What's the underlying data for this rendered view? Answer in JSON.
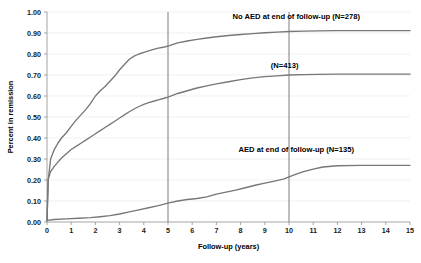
{
  "chart_data": {
    "type": "line",
    "title": "",
    "xlabel": "Follow-up (years)",
    "ylabel": "Percent in remission",
    "xlim": [
      0,
      15
    ],
    "ylim": [
      0,
      1.0
    ],
    "grid": true,
    "legend_position": "inline-annotations",
    "xticks": [
      "0",
      "1",
      "2",
      "3",
      "4",
      "5",
      "6",
      "7",
      "8",
      "9",
      "10",
      "11",
      "12",
      "13",
      "14",
      "15"
    ],
    "yticks": [
      "0.00",
      "0.10",
      "0.20",
      "0.30",
      "0.40",
      "0.50",
      "0.60",
      "0.70",
      "0.80",
      "0.90",
      "1.00"
    ],
    "reference_lines": [
      {
        "name": "year-5-line",
        "x": 5
      },
      {
        "name": "year-10-line",
        "x": 10
      }
    ],
    "series": [
      {
        "name": "No AED at end of follow-up (N=278)",
        "label": "No AED at end of follow-up (N=278)",
        "n": 278,
        "color": "#777777",
        "label_x": 10.3,
        "label_y": 0.965,
        "x": [
          0,
          0.05,
          0.15,
          0.3,
          0.45,
          0.6,
          0.8,
          1.0,
          1.2,
          1.4,
          1.6,
          1.8,
          2.0,
          2.2,
          2.4,
          2.6,
          2.8,
          3.0,
          3.2,
          3.4,
          3.6,
          3.8,
          4.0,
          4.2,
          4.4,
          4.6,
          4.8,
          5.0,
          5.4,
          5.8,
          6.2,
          6.6,
          7.0,
          7.5,
          8.0,
          8.5,
          9.0,
          9.5,
          10.0,
          10.6,
          11.2,
          12.0,
          13.0,
          14.0,
          15.0
        ],
        "y": [
          0.01,
          0.2,
          0.3,
          0.345,
          0.375,
          0.4,
          0.425,
          0.455,
          0.485,
          0.51,
          0.535,
          0.565,
          0.6,
          0.625,
          0.645,
          0.67,
          0.695,
          0.725,
          0.75,
          0.775,
          0.79,
          0.8,
          0.808,
          0.815,
          0.822,
          0.828,
          0.832,
          0.838,
          0.853,
          0.862,
          0.87,
          0.876,
          0.882,
          0.888,
          0.893,
          0.897,
          0.901,
          0.904,
          0.907,
          0.909,
          0.91,
          0.911,
          0.911,
          0.911,
          0.911
        ]
      },
      {
        "name": "(N=413)",
        "label": "(N=413)",
        "n": 413,
        "color": "#777777",
        "label_x": 9.25,
        "label_y": 0.735,
        "x": [
          0,
          0.05,
          0.15,
          0.3,
          0.45,
          0.6,
          0.8,
          1.0,
          1.2,
          1.4,
          1.6,
          1.8,
          2.0,
          2.2,
          2.4,
          2.6,
          2.8,
          3.0,
          3.2,
          3.4,
          3.6,
          3.8,
          4.0,
          4.2,
          4.4,
          4.6,
          4.8,
          5.0,
          5.4,
          5.8,
          6.2,
          6.6,
          7.0,
          7.5,
          8.0,
          8.5,
          9.0,
          9.5,
          10.0,
          10.6,
          11.2,
          12.0,
          13.0,
          14.0,
          15.0
        ],
        "y": [
          0.005,
          0.205,
          0.24,
          0.265,
          0.285,
          0.305,
          0.325,
          0.345,
          0.36,
          0.375,
          0.39,
          0.405,
          0.42,
          0.435,
          0.45,
          0.465,
          0.48,
          0.495,
          0.51,
          0.525,
          0.538,
          0.55,
          0.56,
          0.568,
          0.575,
          0.582,
          0.588,
          0.595,
          0.612,
          0.625,
          0.638,
          0.648,
          0.658,
          0.668,
          0.678,
          0.686,
          0.692,
          0.696,
          0.7,
          0.702,
          0.703,
          0.704,
          0.704,
          0.704,
          0.704
        ]
      },
      {
        "name": "AED at end of follow-up (N=135)",
        "label": "AED at end of follow-up (N=135)",
        "n": 135,
        "color": "#777777",
        "label_x": 10.3,
        "label_y": 0.335,
        "x": [
          0,
          0.3,
          0.8,
          1.3,
          1.8,
          2.2,
          2.6,
          3.0,
          3.4,
          3.8,
          4.2,
          4.6,
          5.0,
          5.4,
          5.8,
          6.2,
          6.6,
          7.0,
          7.4,
          7.8,
          8.2,
          8.6,
          9.0,
          9.4,
          9.8,
          10.0,
          10.3,
          10.6,
          11.0,
          11.4,
          12.0,
          13.0,
          14.0,
          15.0
        ],
        "y": [
          0.008,
          0.012,
          0.015,
          0.018,
          0.021,
          0.025,
          0.03,
          0.038,
          0.048,
          0.058,
          0.068,
          0.078,
          0.09,
          0.1,
          0.107,
          0.112,
          0.12,
          0.133,
          0.142,
          0.152,
          0.163,
          0.175,
          0.185,
          0.195,
          0.205,
          0.215,
          0.228,
          0.24,
          0.252,
          0.262,
          0.268,
          0.27,
          0.27,
          0.27
        ]
      }
    ]
  }
}
